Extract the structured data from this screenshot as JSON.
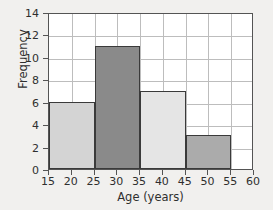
{
  "chart_data": {
    "type": "bar",
    "title": "",
    "xlabel": "Age (years)",
    "ylabel": "Frequency",
    "xlim": [
      15,
      60
    ],
    "ylim": [
      0,
      14
    ],
    "grid": true,
    "legend": "none",
    "xticks": [
      15,
      20,
      25,
      30,
      35,
      40,
      45,
      50,
      55,
      60
    ],
    "yticks": [
      0,
      2,
      4,
      6,
      8,
      10,
      12,
      14
    ],
    "bin_width": 10,
    "categories": [
      "15-25",
      "25-35",
      "35-45",
      "45-55"
    ],
    "values": [
      6,
      11,
      7,
      3
    ],
    "bins": [
      {
        "start": 15,
        "end": 25,
        "frequency": 6,
        "color": "#d4d4d4"
      },
      {
        "start": 25,
        "end": 35,
        "frequency": 11,
        "color": "#8a8a8a"
      },
      {
        "start": 35,
        "end": 45,
        "frequency": 7,
        "color": "#e5e5e5"
      },
      {
        "start": 45,
        "end": 55,
        "frequency": 3,
        "color": "#ababab"
      }
    ]
  },
  "style": {
    "background": "#f1f0ee",
    "plot_background": "#ffffff",
    "grid_color": "#bdbdbd",
    "axis_color": "#545454",
    "bar_edge_color": "#3a3a3a",
    "text_color": "#2f2f2f"
  }
}
